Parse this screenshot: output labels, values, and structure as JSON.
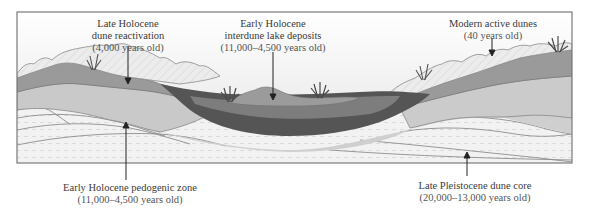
{
  "diagram": {
    "type": "geological cross-section",
    "colors": {
      "sky_top": "#ffffff",
      "sky_bottom": "#e6e6e6",
      "active_dunes": "#e4e4e4",
      "reactivation": "#9a9a9a",
      "pedogenic": "#c9c9c9",
      "lake_dark": "#555555",
      "lake_mid": "#7a7a7a",
      "lake_top": "#999999",
      "core": "#f0f0f0",
      "core_line": "#8a8a8a",
      "frame": "#777777"
    },
    "labels": [
      {
        "id": "late-holocene-reactivation",
        "line1": "Late Holocene",
        "line2": "dune reactivation",
        "age": "(4,000 years old)"
      },
      {
        "id": "early-holocene-lake",
        "line1": "Early Holocene",
        "line2": "interdune lake deposits",
        "age": "(11,000–4,500 years old)"
      },
      {
        "id": "modern-active-dunes",
        "line1": "Modern active dunes",
        "age": "(40 years old)"
      },
      {
        "id": "early-holocene-pedogenic",
        "line1": "Early Holocene pedogenic zone",
        "age": "(11,000–4,500 years old)"
      },
      {
        "id": "late-pleistocene-core",
        "line1": "Late Pleistocene dune core",
        "age": "(20,000–13,000 years old)"
      }
    ]
  }
}
